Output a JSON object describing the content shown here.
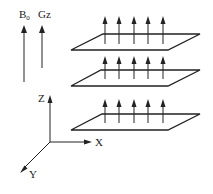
{
  "diagram": {
    "type": "mri-slice-gradient-schematic",
    "legend": {
      "b0": {
        "label": "B",
        "subscript": "0"
      },
      "gz": {
        "label": "Gz"
      }
    },
    "axes": {
      "z_label": "Z",
      "x_label": "X",
      "y_label": "Y"
    },
    "planes": [
      {
        "name": "top-slice",
        "arrow_count": 5
      },
      {
        "name": "middle-slice",
        "arrow_count": 5
      },
      {
        "name": "bottom-slice",
        "arrow_count": 5
      }
    ],
    "colors": {
      "line": "#222222",
      "b0_line": "#888888"
    }
  }
}
